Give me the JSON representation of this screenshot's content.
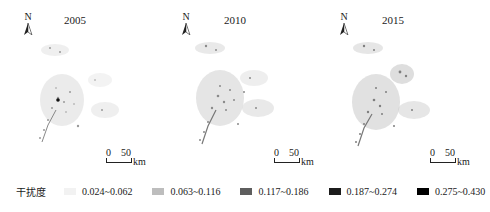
{
  "panels": [
    {
      "year": "2005",
      "north_label": "N",
      "scale": {
        "zero": "0",
        "fifty": "50",
        "unit": "km"
      }
    },
    {
      "year": "2010",
      "north_label": "N",
      "scale": {
        "zero": "0",
        "fifty": "50",
        "unit": "km"
      }
    },
    {
      "year": "2015",
      "north_label": "N",
      "scale": {
        "zero": "0",
        "fifty": "50",
        "unit": "km"
      }
    }
  ],
  "legend": {
    "title": "干扰度",
    "items": [
      {
        "label": "0.024~0.062",
        "color": "#f2f2f2"
      },
      {
        "label": "0.063~0.116",
        "color": "#bdbdbd"
      },
      {
        "label": "0.117~0.186",
        "color": "#5e5e5e"
      },
      {
        "label": "0.187~0.274",
        "color": "#1c1c1c"
      },
      {
        "label": "0.275~0.430",
        "color": "#000000"
      }
    ]
  }
}
